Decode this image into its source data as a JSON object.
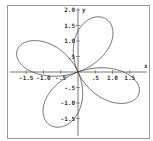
{
  "chart_data": {
    "type": "line",
    "title": "",
    "xlabel": "x",
    "ylabel": "y",
    "xlim": [
      -1.6,
      1.9
    ],
    "ylim": [
      -1.9,
      2.1
    ],
    "grid": false,
    "x_ticks": [
      "-1.5",
      "-1.0",
      "-.5",
      ".5",
      "1.0",
      "1.5"
    ],
    "x_tick_values": [
      -1.5,
      -1.0,
      -0.5,
      0.5,
      1.0,
      1.5
    ],
    "y_ticks": [
      "2.0",
      "1.5",
      "1.0",
      ".5",
      "-.5",
      "-1.0",
      "-1.5"
    ],
    "y_tick_values": [
      2.0,
      1.5,
      1.0,
      0.5,
      -0.5,
      -1.0,
      -1.5
    ],
    "series": [
      {
        "name": "four-petal rose",
        "curve": "polar r = a*sin(2*(theta - phi))",
        "a": 1.9,
        "phi_deg": 22,
        "color": "#444444"
      }
    ]
  },
  "labels": {
    "x_axis": "x",
    "y_axis": "y"
  },
  "colors": {
    "frame": "#888888",
    "axis": "#555555",
    "curve": "#444444"
  }
}
